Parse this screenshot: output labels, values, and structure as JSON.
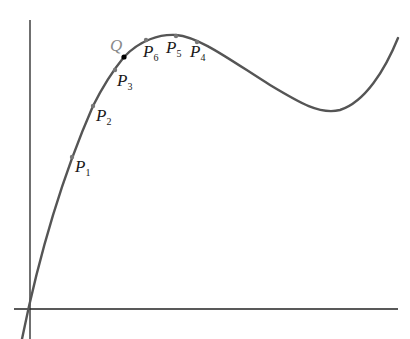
{
  "diagram": {
    "type": "function-curve-with-secant-points",
    "axes": {
      "origin": [
        30,
        309
      ],
      "x_axis": {
        "from": 14,
        "to": 398
      },
      "y_axis": {
        "from": 20,
        "to": 339
      }
    },
    "curve": {
      "color": "#555555",
      "path": "M 22 339 C 40 250, 65 170, 93 106 C 105 82, 115 68, 124 57 C 140 40, 160 34, 176 35 C 200 37, 230 60, 270 85 C 300 103, 320 115, 340 110 C 365 102, 385 70, 398 38"
    },
    "special_point": {
      "label": "Q",
      "x": 124,
      "y": 57,
      "color": "#000000",
      "label_color": "#8a8a8a"
    },
    "points": [
      {
        "label": "P",
        "sub": "1",
        "x": 72,
        "y": 157,
        "lx": 75,
        "ly": 172
      },
      {
        "label": "P",
        "sub": "2",
        "x": 93,
        "y": 106,
        "lx": 96,
        "ly": 121
      },
      {
        "label": "P",
        "sub": "3",
        "x": 115,
        "y": 70,
        "lx": 117,
        "ly": 86
      },
      {
        "label": "P",
        "sub": "6",
        "x": 146,
        "y": 40,
        "lx": 143,
        "ly": 57
      },
      {
        "label": "P",
        "sub": "5",
        "x": 176,
        "y": 36,
        "lx": 166,
        "ly": 53
      },
      {
        "label": "P",
        "sub": "4",
        "x": 197,
        "y": 42,
        "lx": 190,
        "ly": 57
      }
    ]
  }
}
